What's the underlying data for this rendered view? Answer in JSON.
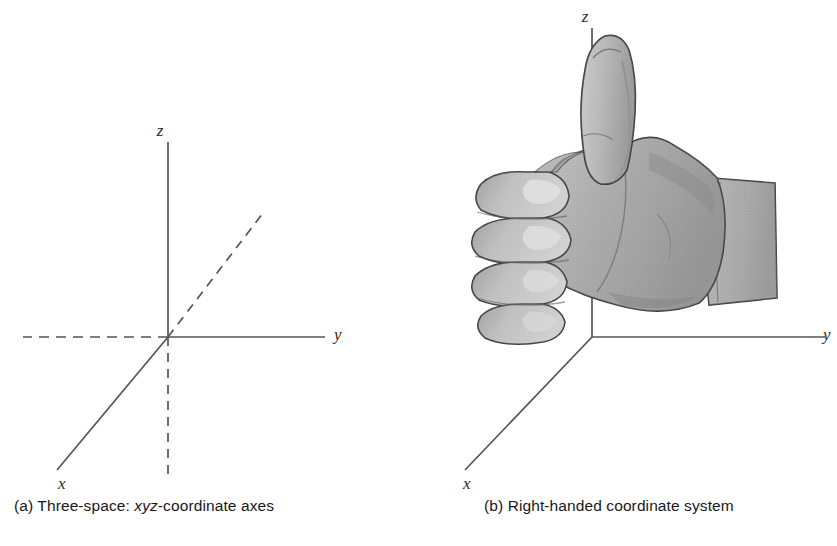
{
  "figure": {
    "background_color": "#ffffff",
    "line_color": "#545454",
    "text_color": "#181818",
    "hand_fill": "#a9a9a9",
    "hand_outline": "#3a3a3a",
    "hand_highlight": "#d2d2d2",
    "hand_shadow": "#7e7e7e"
  },
  "panel_a": {
    "caption_prefix": "(a) Three-space: ",
    "caption_italic": "xyz",
    "caption_suffix": "-coordinate axes",
    "caption_full": "(a) Three-space: xyz-coordinate axes",
    "axes": [
      {
        "name": "x-axis",
        "label": "x",
        "style": "solid",
        "direction": "lower-left"
      },
      {
        "name": "x-axis-negative",
        "label": "",
        "style": "dashed",
        "direction": "upper-right"
      },
      {
        "name": "y-axis",
        "label": "y",
        "style": "solid",
        "direction": "right"
      },
      {
        "name": "y-axis-negative",
        "label": "",
        "style": "dashed",
        "direction": "left"
      },
      {
        "name": "z-axis",
        "label": "z",
        "style": "solid",
        "direction": "up"
      },
      {
        "name": "z-axis-negative",
        "label": "",
        "style": "dashed",
        "direction": "down"
      }
    ],
    "origin_label": ""
  },
  "panel_b": {
    "caption_full": "(b) Right-handed coordinate system",
    "axes": [
      {
        "name": "x-axis",
        "label": "x",
        "style": "solid",
        "direction": "lower-left"
      },
      {
        "name": "y-axis",
        "label": "y",
        "style": "solid",
        "direction": "right"
      },
      {
        "name": "z-axis",
        "label": "z",
        "style": "solid",
        "direction": "up"
      }
    ],
    "illustration": "right-hand-thumbs-up-fist"
  }
}
